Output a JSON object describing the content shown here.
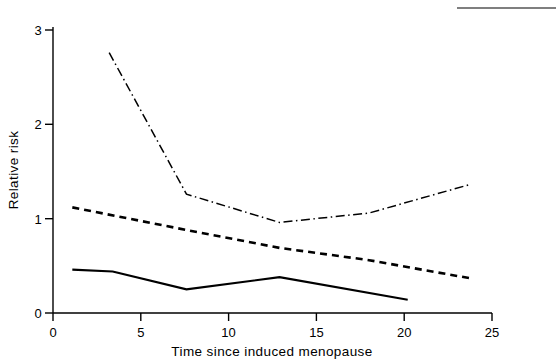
{
  "chart_data": {
    "type": "line",
    "title": "",
    "xlabel": "Time since induced menopause",
    "ylabel": "Relative risk",
    "xlim": [
      0,
      25
    ],
    "ylim": [
      0,
      3
    ],
    "xticks": [
      0,
      5,
      10,
      15,
      20,
      25
    ],
    "yticks": [
      0,
      1,
      2,
      3
    ],
    "xtick_labels": [
      "0",
      "5",
      "10",
      "15",
      "20",
      "25"
    ],
    "ytick_labels": [
      "0",
      "1",
      "2",
      "3"
    ],
    "grid": false,
    "legend": "none",
    "series": [
      {
        "name": "dash-dot-series",
        "style": "dash-dot",
        "x": [
          3.2,
          7.6,
          12.9,
          18.0,
          23.7
        ],
        "y": [
          2.76,
          1.26,
          0.96,
          1.06,
          1.36
        ]
      },
      {
        "name": "dashed-series",
        "style": "dashed",
        "x": [
          1.1,
          7.6,
          12.9,
          18.0,
          23.7
        ],
        "y": [
          1.12,
          0.88,
          0.69,
          0.56,
          0.37
        ]
      },
      {
        "name": "solid-series",
        "style": "solid",
        "x": [
          1.1,
          3.4,
          7.6,
          12.9,
          20.2
        ],
        "y": [
          0.46,
          0.44,
          0.25,
          0.38,
          0.14
        ]
      }
    ]
  },
  "axes": {
    "x_title": "Time since induced menopause",
    "y_title": "Relative risk"
  }
}
